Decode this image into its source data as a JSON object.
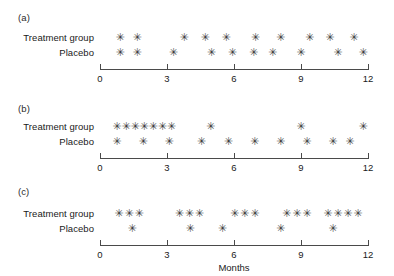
{
  "figure": {
    "marker_glyph": "✳",
    "row_labels": {
      "treatment": "Treatment group",
      "placebo": "Placebo"
    },
    "axis_title": "Months",
    "tick_labels": [
      "0",
      "3",
      "6",
      "9",
      "12"
    ],
    "panel_labels": [
      "(a)",
      "(b)",
      "(c)"
    ]
  },
  "chart_data": {
    "type": "scatter",
    "title": "",
    "xlabel": "Months",
    "ylabel": "",
    "xlim": [
      0,
      12
    ],
    "xticks": [
      0,
      3,
      6,
      9,
      12
    ],
    "grid": false,
    "legend": "none",
    "marker": "asterisk",
    "panels": [
      {
        "label": "(a)",
        "series": [
          {
            "name": "Treatment group",
            "x": [
              0.9,
              1.66,
              3.77,
              4.71,
              5.65,
              6.96,
              8.09,
              9.39,
              10.29,
              11.37
            ]
          },
          {
            "name": "Placebo",
            "x": [
              0.9,
              1.66,
              3.28,
              4.99,
              5.93,
              6.88,
              7.73,
              8.99,
              10.65,
              11.78
            ]
          }
        ]
      },
      {
        "label": "(b)",
        "series": [
          {
            "name": "Treatment group",
            "x": [
              0.76,
              1.17,
              1.57,
              1.98,
              2.38,
              2.79,
              3.19,
              4.95,
              8.99,
              11.78
            ]
          },
          {
            "name": "Placebo",
            "x": [
              0.76,
              1.93,
              3.1,
              4.54,
              5.75,
              6.92,
              8.09,
              9.26,
              10.43,
              11.19
            ]
          }
        ]
      },
      {
        "label": "(c)",
        "series": [
          {
            "name": "Treatment group",
            "x": [
              0.85,
              1.3,
              1.75,
              3.55,
              4.0,
              4.45,
              6.03,
              6.48,
              6.93,
              8.36,
              8.81,
              9.26,
              10.2,
              10.65,
              11.1,
              11.55
            ]
          },
          {
            "name": "Placebo",
            "x": [
              1.44,
              4.04,
              5.48,
              8.09,
              10.43
            ]
          }
        ]
      }
    ]
  }
}
